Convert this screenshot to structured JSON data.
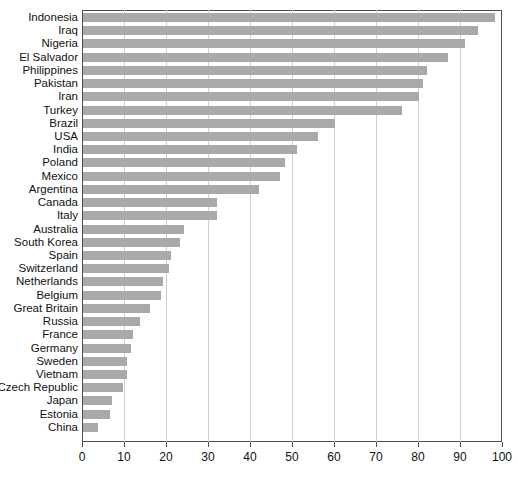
{
  "chart_data": {
    "type": "bar",
    "orientation": "horizontal",
    "title": "",
    "subtitle": "",
    "xlabel": "",
    "ylabel": "",
    "xlim": [
      0,
      100
    ],
    "xticks": [
      0,
      10,
      20,
      30,
      40,
      50,
      60,
      70,
      80,
      90,
      100
    ],
    "grid": "vertical",
    "legend": "none",
    "bar_color": "#a9a9a9",
    "axis_color": "#4d4d4d",
    "grid_color": "#cfcfcf",
    "categories": [
      "Indonesia",
      "Iraq",
      "Nigeria",
      "El Salvador",
      "Philippines",
      "Pakistan",
      "Iran",
      "Turkey",
      "Brazil",
      "USA",
      "India",
      "Poland",
      "Mexico",
      "Argentina",
      "Canada",
      "Italy",
      "Australia",
      "South Korea",
      "Spain",
      "Switzerland",
      "Netherlands",
      "Belgium",
      "Great Britain",
      "Russia",
      "France",
      "Germany",
      "Sweden",
      "Vietnam",
      "Czech Republic",
      "Japan",
      "Estonia",
      "China"
    ],
    "values": [
      98,
      94,
      91,
      87,
      82,
      81,
      80,
      76,
      60,
      56,
      51,
      48,
      47,
      42,
      32,
      32,
      24,
      23,
      21,
      20.5,
      19,
      18.5,
      16,
      13.5,
      12,
      11.5,
      10.5,
      10.5,
      9.5,
      7,
      6.5,
      3.5
    ]
  }
}
